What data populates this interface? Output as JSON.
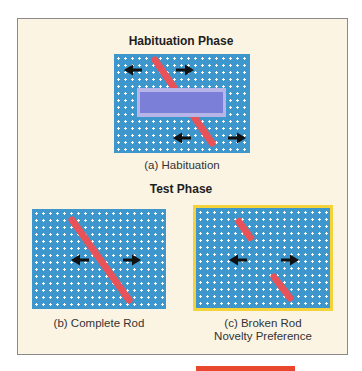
{
  "figure": {
    "habituation_title": "Habituation Phase",
    "test_title": "Test Phase",
    "panels": [
      {
        "id": "a",
        "caption": "(a) Habituation"
      },
      {
        "id": "b",
        "caption": "(b) Complete Rod"
      },
      {
        "id": "c",
        "caption_line1": "(c) Broken Rod",
        "caption_line2": "Novelty Preference"
      }
    ],
    "colors": {
      "background": "#fbf4e3",
      "panel_blue": "#3d97cc",
      "rod_red": "#e8535a",
      "occluder_outer": "#b7b4e8",
      "occluder_inner": "#7c7fd8",
      "highlight_yellow": "#f4d23a",
      "arrow": "#111111",
      "bottom_bar": "#e8472e"
    }
  }
}
